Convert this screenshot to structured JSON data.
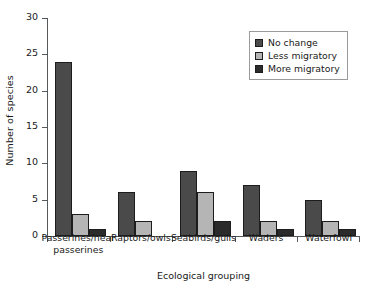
{
  "chart_data": {
    "type": "bar",
    "title": "",
    "xlabel": "Ecological grouping",
    "ylabel": "Number of species",
    "categories": [
      "Passerines/near passerines",
      "Raptors/owls",
      "Seabirds/gulls",
      "Waders",
      "Waterfowl"
    ],
    "category_lines": [
      [
        "Passerines/near",
        "passerines"
      ],
      [
        "Raptors/owls"
      ],
      [
        "Seabirds/gulls"
      ],
      [
        "Waders"
      ],
      [
        "Waterfowl"
      ]
    ],
    "series": [
      {
        "name": "No change",
        "color": "#4a4a4a",
        "values": [
          24,
          6,
          9,
          7,
          5
        ]
      },
      {
        "name": "Less migratory",
        "color": "#b5b5b5",
        "values": [
          3,
          2,
          6,
          2,
          2
        ]
      },
      {
        "name": "More migratory",
        "color": "#2b2b2b",
        "values": [
          1,
          0,
          2,
          1,
          1
        ]
      }
    ],
    "ylim": [
      0,
      30
    ],
    "yticks": [
      0,
      5,
      10,
      15,
      20,
      25,
      30
    ],
    "ytick_labels": [
      "0",
      "5",
      "10",
      "15",
      "20",
      "25",
      "30"
    ],
    "grid": false,
    "legend_position": "upper right"
  }
}
